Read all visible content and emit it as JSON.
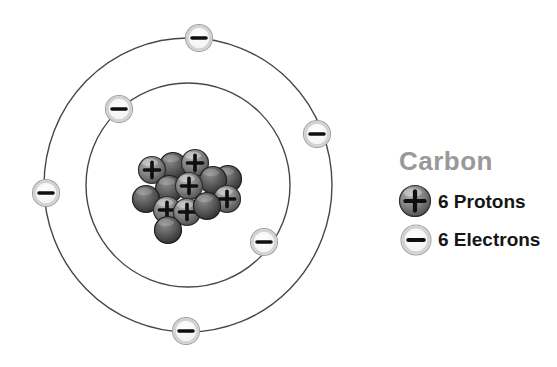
{
  "element": {
    "name": "Carbon",
    "proton_count": 6,
    "electron_count": 6,
    "shell_electron_counts": [
      2,
      4
    ]
  },
  "legend": {
    "title": "Carbon",
    "items": [
      {
        "icon": "proton-icon",
        "sign": "+",
        "label": "6 Protons"
      },
      {
        "icon": "electron-icon",
        "sign": "−",
        "label": "6 Electrons"
      }
    ]
  },
  "colors": {
    "background": "#ffffff",
    "orbit": "#474747",
    "sign": "#0f0f0f",
    "electron_center": "#ffffff",
    "electron_edge": "#ececec",
    "electron_ring": "#d2d2d2",
    "electron_outline": "#9e9e9e",
    "proton_hi": "#b2b2b2",
    "proton_mid": "#7e7e7e",
    "proton_dark": "#474747",
    "proton_outline": "#2f2f2f",
    "neutron_hi": "#8c8c8c",
    "neutron_mid": "#575757",
    "neutron_dark": "#2c2c2c",
    "neutron_outline": "#1e1e1e",
    "title_text": "#999999",
    "label_text": "#161616"
  },
  "diagram": {
    "center": {
      "x": 188,
      "y": 185
    },
    "orbits": [
      {
        "name": "inner-shell",
        "rx": 102,
        "ry": 102
      },
      {
        "name": "outer-shell",
        "rx": 144,
        "ry": 147
      }
    ],
    "electron_radius": 13.5,
    "electrons": [
      {
        "shell": "outer",
        "x": 199,
        "y": 38
      },
      {
        "shell": "outer",
        "x": 317,
        "y": 134
      },
      {
        "shell": "outer",
        "x": 46,
        "y": 193
      },
      {
        "shell": "outer",
        "x": 186,
        "y": 331
      },
      {
        "shell": "inner",
        "x": 119,
        "y": 109
      },
      {
        "shell": "inner",
        "x": 264,
        "y": 242
      }
    ],
    "nucleus": {
      "particle_radius": 13.5,
      "particles": [
        {
          "type": "neutron",
          "x": 173,
          "y": 166
        },
        {
          "type": "neutron",
          "x": 228,
          "y": 179
        },
        {
          "type": "proton",
          "x": 152,
          "y": 170
        },
        {
          "type": "proton",
          "x": 195,
          "y": 163
        },
        {
          "type": "neutron",
          "x": 213,
          "y": 180
        },
        {
          "type": "neutron",
          "x": 169,
          "y": 189
        },
        {
          "type": "neutron",
          "x": 146,
          "y": 199
        },
        {
          "type": "proton",
          "x": 189,
          "y": 186
        },
        {
          "type": "proton",
          "x": 227,
          "y": 199
        },
        {
          "type": "proton",
          "x": 167,
          "y": 210
        },
        {
          "type": "proton",
          "x": 187,
          "y": 212
        },
        {
          "type": "neutron",
          "x": 207,
          "y": 206
        },
        {
          "type": "neutron",
          "x": 168,
          "y": 230
        }
      ]
    },
    "legend_icons": {
      "proton": {
        "x": 415,
        "y": 201,
        "r": 15.5
      },
      "electron": {
        "x": 416,
        "y": 240,
        "r": 15
      }
    }
  }
}
